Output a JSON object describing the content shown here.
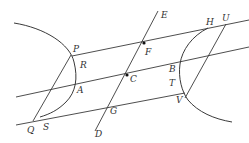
{
  "figure": {
    "type": "hyperbola-conjugate-diameter-diagram",
    "colors": {
      "stroke": "#3a3a3a",
      "label": "#333333",
      "background": "#ffffff"
    },
    "labels": {
      "P": "P",
      "R": "R",
      "A": "A",
      "Q": "Q",
      "S": "S",
      "E": "E",
      "F": "F",
      "C": "C",
      "G": "G",
      "D": "D",
      "H": "H",
      "U": "U",
      "B": "B",
      "T": "T",
      "V": "V"
    },
    "points": {
      "P": [
        72,
        56
      ],
      "R": [
        74,
        66
      ],
      "A": [
        75,
        86
      ],
      "Q": [
        33,
        121
      ],
      "S": [
        42,
        116
      ],
      "E": [
        158,
        11
      ],
      "F": [
        144,
        43
      ],
      "C": [
        128,
        75
      ],
      "G": [
        111,
        107
      ],
      "D": [
        95,
        131
      ],
      "H": [
        208,
        28
      ],
      "U": [
        226,
        24
      ],
      "B": [
        181,
        63
      ],
      "T": [
        179,
        88
      ],
      "V": [
        185,
        97
      ]
    },
    "elements": [
      "left-hyperbola-branch",
      "right-hyperbola-branch",
      "diameter-line-DE",
      "parallel-chord-PU",
      "parallel-chord-through-C",
      "parallel-chord-QV",
      "line-QP",
      "line-UV"
    ]
  }
}
